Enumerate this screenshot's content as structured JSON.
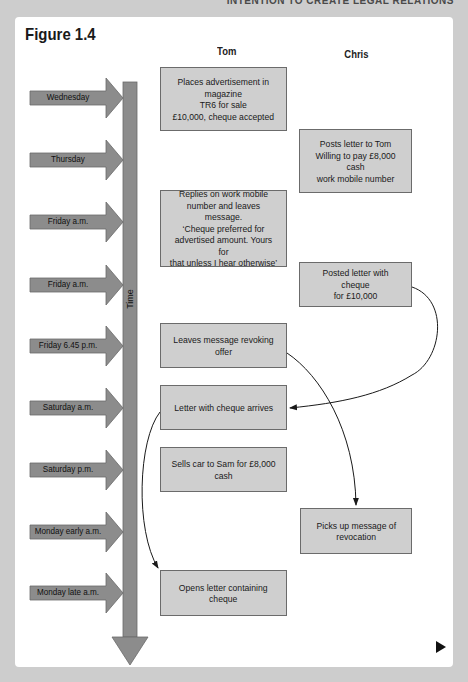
{
  "running_head": "INTENTION TO CREATE LEGAL RELATIONS",
  "figure": {
    "title": "Figure 1.4",
    "columns": {
      "tom": "Tom",
      "chris": "Chris"
    },
    "timeline_label": "Time",
    "timeline": [
      "Wednesday",
      "Thursday",
      "Friday a.m.",
      "Friday a.m.",
      "Friday 6.45 p.m.",
      "Saturday a.m.",
      "Saturday p.m.",
      "Monday early a.m.",
      "Monday late a.m."
    ],
    "tom_events": [
      "Places advertisement in\nmagazine\nTR6 for sale\n£10,000, cheque accepted",
      "Replies on work mobile\nnumber and leaves message.\n‘Cheque preferred for\nadvertised amount. Yours for\nthat unless I hear otherwise’",
      "Leaves message revoking\noffer",
      "Letter with cheque arrives",
      "Sells car to Sam for £8,000\ncash",
      "Opens letter containing\ncheque"
    ],
    "chris_events": [
      "Posts letter to Tom\nWilling to pay £8,000 cash\nwork mobile number",
      "Posted letter with cheque\nfor £10,000",
      "Picks up message of\nrevocation"
    ],
    "connections": [
      {
        "from": "Posted letter with cheque for £10,000",
        "to": "Letter with cheque arrives"
      },
      {
        "from": "Leaves message revoking offer",
        "to": "Picks up message of revocation"
      },
      {
        "from": "Letter with cheque arrives",
        "to": "Opens letter containing cheque"
      }
    ]
  },
  "colors": {
    "background": "#cdcdcd",
    "card": "#ffffff",
    "box_fill": "#cfcfcf",
    "arrow_fill": "#8c8c8c",
    "line": "#1a1a1a"
  },
  "navigation": {
    "next_icon": "play-triangle-icon"
  }
}
